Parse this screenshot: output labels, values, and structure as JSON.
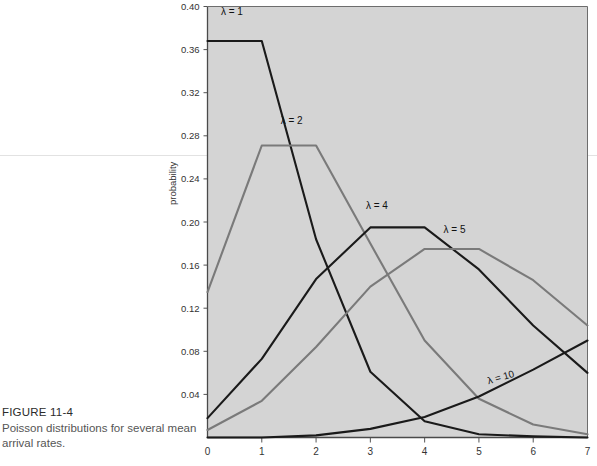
{
  "figure": {
    "number": "FIGURE 11-4",
    "caption": "Poisson distributions for several mean arrival rates."
  },
  "chart_data": {
    "type": "line",
    "title": "",
    "xlabel": "",
    "ylabel": "probability",
    "xlim": [
      0,
      7
    ],
    "ylim": [
      0,
      0.4
    ],
    "xticks": [
      "0",
      "1",
      "2",
      "3",
      "4",
      "5",
      "6",
      "7"
    ],
    "yticks": [
      "0.04",
      "0.08",
      "0.12",
      "0.16",
      "0.20",
      "0.24",
      "0.28",
      "0.32",
      "0.36",
      "0.40"
    ],
    "grid": false,
    "legend_position": "inline-annotations",
    "plot_background": "#d4d4d4",
    "x": [
      0,
      1,
      2,
      3,
      4,
      5,
      6,
      7
    ],
    "series": [
      {
        "name": "λ = 1",
        "label": "λ = 1",
        "color": "#1a1a1a",
        "values": [
          0.368,
          0.368,
          0.184,
          0.061,
          0.015,
          0.003,
          0.001,
          0.0
        ]
      },
      {
        "name": "λ = 2",
        "label": "λ = 2",
        "color": "#7a7a7a",
        "values": [
          0.135,
          0.271,
          0.271,
          0.18,
          0.09,
          0.036,
          0.012,
          0.003
        ]
      },
      {
        "name": "λ = 4",
        "label": "λ = 4",
        "color": "#1a1a1a",
        "values": [
          0.018,
          0.073,
          0.147,
          0.195,
          0.195,
          0.156,
          0.104,
          0.06
        ]
      },
      {
        "name": "λ = 5",
        "label": "λ = 5",
        "color": "#7a7a7a",
        "values": [
          0.007,
          0.034,
          0.084,
          0.14,
          0.175,
          0.175,
          0.146,
          0.104
        ]
      },
      {
        "name": "λ = 10",
        "label": "λ = 10",
        "color": "#1a1a1a",
        "values": [
          0.0,
          0.0,
          0.002,
          0.008,
          0.019,
          0.038,
          0.063,
          0.09
        ]
      }
    ],
    "annotations": [
      {
        "text": "λ = 1",
        "x": 0.45,
        "y": 0.392,
        "rotate": 0
      },
      {
        "text": "λ = 2",
        "x": 1.55,
        "y": 0.291,
        "rotate": 0
      },
      {
        "text": "λ = 4",
        "x": 3.12,
        "y": 0.212,
        "rotate": 0
      },
      {
        "text": "λ = 5",
        "x": 4.55,
        "y": 0.19,
        "rotate": 0
      },
      {
        "text": "λ = 10",
        "x": 5.42,
        "y": 0.053,
        "rotate": -16
      }
    ]
  }
}
